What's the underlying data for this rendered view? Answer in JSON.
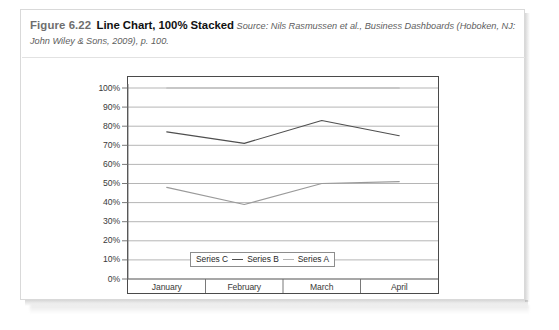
{
  "figure": {
    "label": "Figure 6.22",
    "title": "Line Chart, 100% Stacked",
    "source": "Source: Nils Rasmussen et al., Business Dashboards (Hoboken, NJ: John Wiley & Sons, 2009), p. 100."
  },
  "chart_data": {
    "type": "line",
    "title": "",
    "xlabel": "",
    "ylabel": "",
    "categories": [
      "January",
      "February",
      "March",
      "April"
    ],
    "series": [
      {
        "name": "Series C",
        "values": [
          48,
          39,
          50,
          51
        ],
        "color": "#9a9a9a"
      },
      {
        "name": "Series B",
        "values": [
          77,
          71,
          83,
          75
        ],
        "color": "#4f4f4f"
      },
      {
        "name": "Series A",
        "values": [
          100,
          100,
          100,
          100
        ],
        "color": "#b4b4b4"
      }
    ],
    "ylim": [
      0,
      100
    ],
    "ytick_labels": [
      "100%",
      "90%",
      "80%",
      "70%",
      "60%",
      "50%",
      "40%",
      "30%",
      "20%",
      "10%",
      "0%"
    ],
    "ytick_values": [
      100,
      90,
      80,
      70,
      60,
      50,
      40,
      30,
      20,
      10,
      0
    ],
    "grid": true,
    "grid_color": "#959595",
    "legend_position": "inside-bottom-left",
    "legend_separator": "–"
  }
}
